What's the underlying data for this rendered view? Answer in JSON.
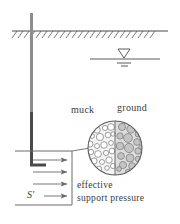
{
  "figure": {
    "colors": {
      "line": "#4a4a4a",
      "pipe": "#555555",
      "text": "#3a3a3a",
      "grain_fill_left": "#ffffff",
      "grain_fill_right": "#c9c9c9",
      "background": "#ffffff"
    },
    "labels": {
      "muck": "muck",
      "ground": "ground",
      "effective": "effective",
      "support_pressure": "support pressure",
      "stress_symbol": "S'"
    },
    "ground_surface": {
      "name": "ground-surface-hatch",
      "y": 31,
      "x_start": 12,
      "x_end": 168,
      "hatch_count": 24,
      "hatch_length": 9,
      "hatch_angle_deg": 55
    },
    "water_table": {
      "name": "water-table-symbol",
      "line_y": 59,
      "x_start": 90,
      "x_end": 160,
      "triangle_center_x": 124,
      "triangle_top_y": 49,
      "tick_widths": [
        14,
        7
      ]
    },
    "shaft": {
      "name": "vertical-shaft-pipe",
      "x": 31,
      "top_y": 13,
      "bottom_y": 160,
      "width": 3,
      "elbow_x_end": 46,
      "elbow_y": 167
    },
    "pressure_box": {
      "name": "support-pressure-box",
      "left": 15,
      "right": 72,
      "top": 151,
      "bottom": 205
    },
    "arrows": {
      "name": "pressure-arrows",
      "count": 4,
      "x_start": 32,
      "x_end": 68,
      "ys": [
        160,
        172,
        184,
        196
      ]
    },
    "inset_circle": {
      "name": "grain-structure-inset",
      "center_x": 115,
      "center_y": 148,
      "radius": 27,
      "divider_x": 115,
      "leader_line": {
        "x_start": 72,
        "y_start": 151,
        "x_end": 89,
        "y_end": 148
      }
    },
    "grains": {
      "left_side": [
        {
          "cx": 97,
          "cy": 130,
          "r": 3.2
        },
        {
          "cx": 105,
          "cy": 128,
          "r": 2.6
        },
        {
          "cx": 111,
          "cy": 127,
          "r": 3.4
        },
        {
          "cx": 92,
          "cy": 136,
          "r": 2.4
        },
        {
          "cx": 100,
          "cy": 137,
          "r": 3.6
        },
        {
          "cx": 108,
          "cy": 135,
          "r": 2.8
        },
        {
          "cx": 113,
          "cy": 134,
          "r": 2.2
        },
        {
          "cx": 90,
          "cy": 144,
          "r": 3.0
        },
        {
          "cx": 97,
          "cy": 146,
          "r": 2.5
        },
        {
          "cx": 104,
          "cy": 145,
          "r": 3.3
        },
        {
          "cx": 111,
          "cy": 143,
          "r": 2.4
        },
        {
          "cx": 91,
          "cy": 152,
          "r": 2.7
        },
        {
          "cx": 98,
          "cy": 154,
          "r": 3.4
        },
        {
          "cx": 106,
          "cy": 153,
          "r": 2.6
        },
        {
          "cx": 112,
          "cy": 151,
          "r": 2.9
        },
        {
          "cx": 94,
          "cy": 161,
          "r": 3.1
        },
        {
          "cx": 102,
          "cy": 162,
          "r": 2.5
        },
        {
          "cx": 109,
          "cy": 160,
          "r": 3.2
        },
        {
          "cx": 99,
          "cy": 169,
          "r": 2.8
        },
        {
          "cx": 107,
          "cy": 168,
          "r": 2.3
        },
        {
          "cx": 113,
          "cy": 166,
          "r": 2.6
        },
        {
          "cx": 95,
          "cy": 122,
          "r": 2.0
        },
        {
          "cx": 103,
          "cy": 121,
          "r": 2.2
        },
        {
          "cx": 110,
          "cy": 119,
          "r": 1.8
        }
      ],
      "right_side": [
        {
          "cx": 122,
          "cy": 127,
          "r": 3.6
        },
        {
          "cx": 131,
          "cy": 129,
          "r": 4.2
        },
        {
          "cx": 138,
          "cy": 134,
          "r": 3.0
        },
        {
          "cx": 120,
          "cy": 136,
          "r": 3.2
        },
        {
          "cx": 128,
          "cy": 138,
          "r": 4.4
        },
        {
          "cx": 137,
          "cy": 142,
          "r": 3.4
        },
        {
          "cx": 120,
          "cy": 146,
          "r": 3.8
        },
        {
          "cx": 129,
          "cy": 148,
          "r": 4.6
        },
        {
          "cx": 138,
          "cy": 151,
          "r": 3.2
        },
        {
          "cx": 121,
          "cy": 156,
          "r": 3.4
        },
        {
          "cx": 130,
          "cy": 158,
          "r": 4.0
        },
        {
          "cx": 138,
          "cy": 159,
          "r": 2.8
        },
        {
          "cx": 123,
          "cy": 165,
          "r": 3.6
        },
        {
          "cx": 132,
          "cy": 166,
          "r": 3.4
        },
        {
          "cx": 126,
          "cy": 121,
          "r": 2.6
        },
        {
          "cx": 134,
          "cy": 123,
          "r": 2.4
        },
        {
          "cx": 128,
          "cy": 172,
          "r": 2.8
        },
        {
          "cx": 119,
          "cy": 169,
          "r": 2.4
        }
      ]
    }
  }
}
